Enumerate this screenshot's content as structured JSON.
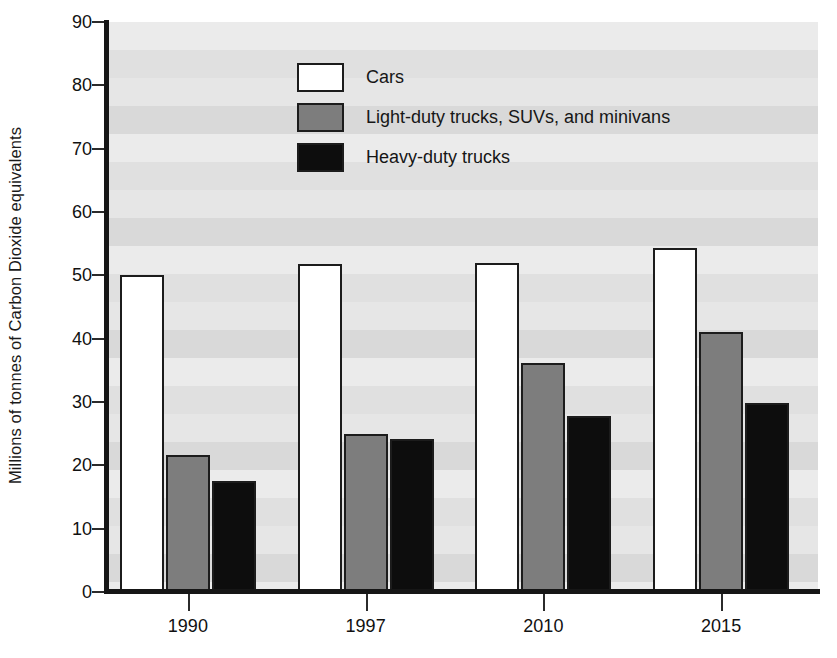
{
  "chart_data": {
    "type": "bar",
    "title": "",
    "xlabel": "",
    "ylabel": "Millions of tonnes of Carbon Dioxide equivalents",
    "categories": [
      "1990",
      "1997",
      "2010",
      "2015"
    ],
    "series": [
      {
        "name": "Cars",
        "color": "#ffffff",
        "values": [
          50.0,
          51.8,
          52.0,
          54.3
        ]
      },
      {
        "name": "Light-duty trucks, SUVs, and minivans",
        "color": "#7d7d7d",
        "values": [
          21.7,
          25.0,
          36.2,
          41.0
        ]
      },
      {
        "name": "Heavy-duty trucks",
        "color": "#0d0d0d",
        "values": [
          17.5,
          24.2,
          27.8,
          29.8
        ]
      }
    ],
    "ylim": [
      0,
      90
    ],
    "yticks": [
      0,
      10,
      20,
      30,
      40,
      50,
      60,
      70,
      80,
      90
    ],
    "ytick_labels": [
      "0",
      "10",
      "20",
      "30",
      "40",
      "50",
      "60",
      "70",
      "80",
      "90"
    ],
    "grid": false,
    "background_bands": true,
    "legend_position": "upper-center",
    "bar_outline_color": "#1c1c1c"
  },
  "axis": {
    "y_title": "Millions of tonnes of Carbon Dioxide equivalents"
  },
  "legend": {
    "entries": [
      {
        "label": "Cars"
      },
      {
        "label": "Light-duty trucks, SUVs, and minivans"
      },
      {
        "label": "Heavy-duty trucks"
      }
    ]
  }
}
